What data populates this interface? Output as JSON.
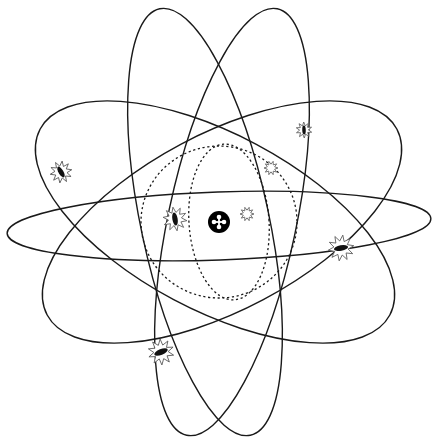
{
  "diagram": {
    "title": "",
    "colors": {
      "line": "#1a1a1a",
      "nucleus": "#000000",
      "background": "#ffffff",
      "star_outline": "#555555"
    },
    "center": {
      "x": 219,
      "y": 222
    },
    "nucleus": {
      "x": 219,
      "y": 222,
      "r": 11,
      "symbol": "cross-dots"
    },
    "inner_orbits": [
      {
        "name": "inner-orbit-circle",
        "cx": 219,
        "cy": 222,
        "rx": 78,
        "ry": 76,
        "rotate": 0
      },
      {
        "name": "inner-orbit-vertical",
        "cx": 229,
        "cy": 222,
        "rx": 40,
        "ry": 78,
        "rotate": -4
      }
    ],
    "orbits": [
      {
        "name": "orbit-horizontal",
        "cx": 219,
        "cy": 226,
        "rx": 212,
        "ry": 34,
        "rotate": -2
      },
      {
        "name": "orbit-tilt-left-shallow",
        "cx": 215,
        "cy": 222,
        "rx": 198,
        "ry": 88,
        "rotate": 28
      },
      {
        "name": "orbit-tilt-right-shallow",
        "cx": 222,
        "cy": 222,
        "rx": 198,
        "ry": 88,
        "rotate": -28
      },
      {
        "name": "orbit-tilt-left-steep",
        "cx": 205,
        "cy": 222,
        "rx": 218,
        "ry": 64,
        "rotate": 78
      },
      {
        "name": "orbit-tilt-right-steep",
        "cx": 232,
        "cy": 222,
        "rx": 218,
        "ry": 64,
        "rotate": -78
      }
    ],
    "electrons": [
      {
        "name": "electron-left",
        "x": 61,
        "y": 172,
        "size": 11,
        "angle": 60,
        "filled": true
      },
      {
        "name": "electron-inner-left",
        "x": 175,
        "y": 219,
        "size": 12,
        "angle": 80,
        "filled": true
      },
      {
        "name": "electron-top-right",
        "x": 304,
        "y": 130,
        "size": 8,
        "angle": 88,
        "filled": true
      },
      {
        "name": "electron-inner-top-right",
        "x": 271,
        "y": 168,
        "size": 7,
        "angle": 0,
        "filled": false
      },
      {
        "name": "electron-inner-right",
        "x": 247,
        "y": 214,
        "size": 7,
        "angle": 0,
        "filled": false
      },
      {
        "name": "electron-right",
        "x": 341,
        "y": 248,
        "size": 13,
        "angle": -10,
        "filled": true
      },
      {
        "name": "electron-bottom-left",
        "x": 161,
        "y": 352,
        "size": 13,
        "angle": -22,
        "filled": true
      }
    ]
  }
}
